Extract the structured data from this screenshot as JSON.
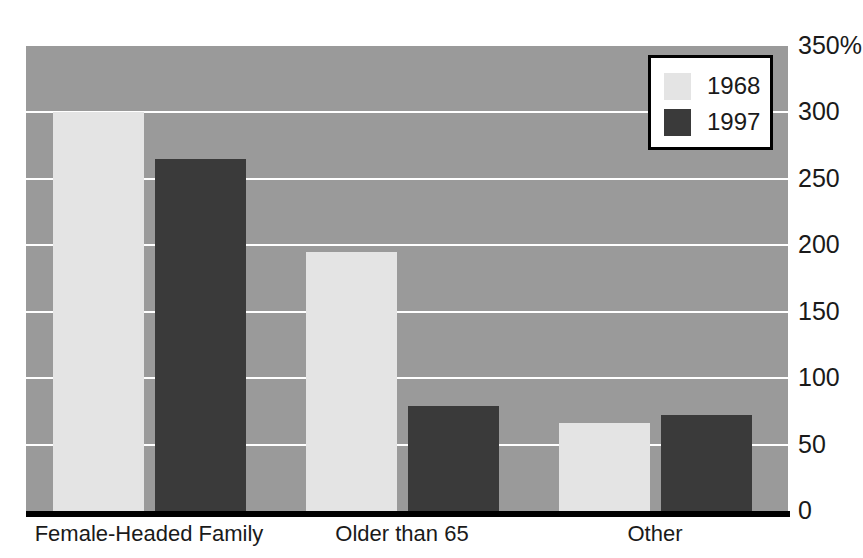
{
  "chart_data": {
    "type": "bar",
    "title": "",
    "subtitle": "",
    "xlabel": "",
    "ylabel": "",
    "categories": [
      "Female-Headed Family",
      "Older than 65",
      "Other"
    ],
    "series": [
      {
        "name": "1968",
        "color": "#e4e4e4",
        "values": [
          300,
          195,
          66
        ]
      },
      {
        "name": "1997",
        "color": "#3a3a3a",
        "values": [
          265,
          79,
          72
        ]
      }
    ],
    "ylim": [
      0,
      350
    ],
    "yticks": [
      0,
      50,
      100,
      150,
      200,
      250,
      300,
      350
    ],
    "ytick_labels": [
      "0",
      "50",
      "100",
      "150",
      "200",
      "250",
      "300",
      "350%"
    ],
    "grid": true,
    "legend_position": "top-right",
    "plot_background_color": "#9a9a9a",
    "gridline_color": "#ffffff",
    "axis_color": "#000000"
  },
  "legend": {
    "entries": [
      {
        "label": "1968",
        "swatch_name": "legend-swatch-1968"
      },
      {
        "label": "1997",
        "swatch_name": "legend-swatch-1997"
      }
    ]
  }
}
